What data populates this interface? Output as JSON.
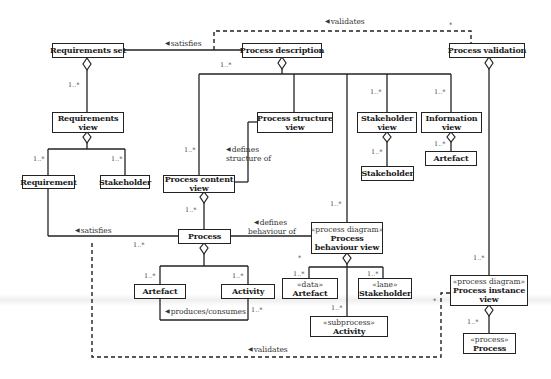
{
  "diagram": {
    "type": "UML class diagram (process modelling views)",
    "nodes": {
      "requirements_set": {
        "name": "Requirements set"
      },
      "process_description": {
        "name": "Process description"
      },
      "process_validation": {
        "name": "Process validation"
      },
      "requirements_view": {
        "name_line1": "Requirements",
        "name_line2": "view"
      },
      "process_structure_view": {
        "name_line1": "Process structure",
        "name_line2": "view"
      },
      "stakeholder_view": {
        "name_line1": "Stakeholder",
        "name_line2": "view"
      },
      "information_view": {
        "name_line1": "Information",
        "name_line2": "view"
      },
      "requirement": {
        "name": "Requirement"
      },
      "stakeholder_req": {
        "name": "Stakeholder"
      },
      "process_content_view": {
        "name_line1": "Process content",
        "name_line2": "view"
      },
      "stakeholder_sv": {
        "name": "Stakeholder"
      },
      "artefact_iv": {
        "name": "Artefact"
      },
      "process": {
        "name": "Process"
      },
      "process_behaviour_view": {
        "stereotype": "«process diagram»",
        "name_line1": "Process",
        "name_line2": "behaviour view"
      },
      "artefact": {
        "name": "Artefact"
      },
      "activity": {
        "name": "Activity"
      },
      "data_artefact": {
        "stereotype": "«data»",
        "name": "Artefact"
      },
      "lane_stakeholder": {
        "stereotype": "«lane»",
        "name": "Stakeholder"
      },
      "subprocess_activity": {
        "stereotype": "«subprocess»",
        "name": "Activity"
      },
      "process_instance_view": {
        "stereotype": "«process diagram»",
        "name_line1": "Process instance",
        "name_line2": "view"
      },
      "process_instance_process": {
        "stereotype": "«process»",
        "name": "Process"
      }
    },
    "labels": {
      "validates_top": "validates",
      "satisfies_top": "satisfies",
      "defines_structure_1": "defines",
      "defines_structure_2": "structure of",
      "satisfies_mid": "satisfies",
      "defines_behaviour_1": "defines",
      "defines_behaviour_2": "behaviour of",
      "produces_consumes": "produces/consumes",
      "validates_bottom": "validates",
      "arrow_glyph": "◀"
    },
    "multiplicities": {
      "req_view": "1..*",
      "desc_left": "1..*",
      "pcv": "1..*",
      "sv": "1..*",
      "iv": "1..*",
      "requirement": "1..*",
      "stakeholder_req": "1..*",
      "stakeholder_sv": "1..*",
      "artefact_iv": "1..*",
      "process_from_pcv": "1..*",
      "satisfies_req": "1..*",
      "pbv": "1..*",
      "artefact": "1..*",
      "activity": "1..*",
      "activity_pc": "1..*",
      "pbv_star": "*",
      "data_artefact": "1..*",
      "lane_stakeholder": "1..*",
      "subprocess": "1..*",
      "piv_top": "1..*",
      "piv_process": "1..*",
      "validates_top_star": "*",
      "validates_bottom_star": "*"
    }
  }
}
